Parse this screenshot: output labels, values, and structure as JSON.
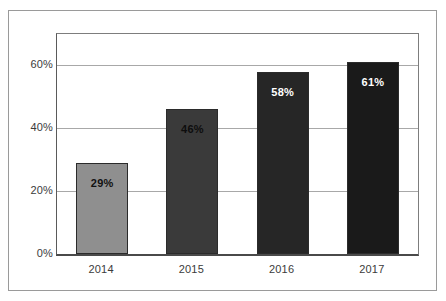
{
  "chart_data": {
    "type": "bar",
    "title": "",
    "subtitle": "",
    "xlabel": "",
    "ylabel": "",
    "categories": [
      "2014",
      "2015",
      "2016",
      "2017"
    ],
    "values": [
      29,
      46,
      58,
      61
    ],
    "value_labels": [
      "29%",
      "46%",
      "58%",
      "61%"
    ],
    "bar_colors": [
      "#8f8f8f",
      "#3a3a3a",
      "#262626",
      "#1a1a1a"
    ],
    "bar_label_colors": [
      "#111111",
      "#0d0d0d",
      "#ffffff",
      "#ffffff"
    ],
    "bar_border_color": "#2b2b2b",
    "ylim": [
      0,
      70
    ],
    "ytick_values": [
      0,
      20,
      40,
      60
    ],
    "ytick_labels": [
      "0%",
      "20%",
      "40%",
      "60%"
    ],
    "grid": true,
    "grid_color": "#a8a8a8",
    "legend": "none",
    "frame_color": "#9a9a9a",
    "background_color": "#ffffff"
  }
}
